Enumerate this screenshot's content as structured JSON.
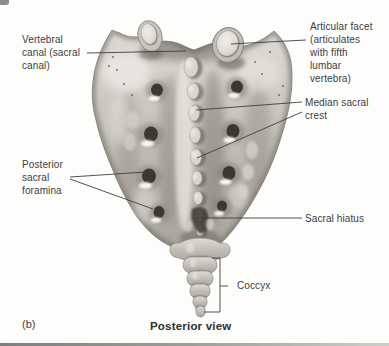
{
  "figure": {
    "panel_letter": "(b)",
    "caption": "Posterior view"
  },
  "labels": {
    "vertebral_canal": "Vertebral\ncanal (sacral\ncanal)",
    "articular_facet": "Articular facet\n(articulates\nwith fifth\nlumbar\nvertebra)",
    "median_sacral_crest": "Median sacral\ncrest",
    "posterior_sacral_foramina": "Posterior\nsacral\nforamina",
    "sacral_hiatus": "Sacral hiatus",
    "coccyx": "Coccyx"
  },
  "colors": {
    "background": "#fdfdfc",
    "label_text": "#3d3d3d",
    "leader_line": "#3f3f3f",
    "bone_light": "#e4e2dd",
    "bone_mid": "#bcb8b1",
    "bone_shadow": "#6f6b63"
  }
}
